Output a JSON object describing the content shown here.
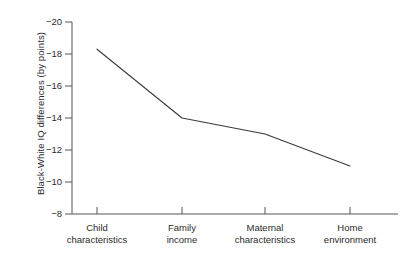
{
  "chart_data": {
    "type": "line",
    "title": "",
    "xlabel": "",
    "ylabel": "Black-White IQ differences (by points)",
    "categories": [
      "Child characteristics",
      "Family income",
      "Maternal characteristics",
      "Home environment"
    ],
    "category_lines": [
      [
        "Child",
        "characteristics"
      ],
      [
        "Family",
        "income"
      ],
      [
        "Maternal",
        "characteristics"
      ],
      [
        "Home",
        "environment"
      ]
    ],
    "values": [
      -18.3,
      -14.0,
      -13.0,
      -11.0
    ],
    "series": [
      {
        "name": "Black-White IQ difference",
        "values": [
          -18.3,
          -14.0,
          -13.0,
          -11.0
        ]
      }
    ],
    "yticks": [
      -20,
      -18,
      -16,
      -14,
      -12,
      -10,
      -8
    ],
    "ytick_labels": [
      "−20",
      "−18",
      "−16",
      "−14",
      "−12",
      "−10",
      "−8"
    ],
    "ylim": [
      -8,
      -20
    ],
    "y_axis_inverted": true,
    "grid": false,
    "legend": false,
    "line_color": "#3a3a3a",
    "background_color": "#ffffff"
  },
  "figure": {
    "axis_color": "#555555",
    "text_color": "#2b2b2b"
  }
}
